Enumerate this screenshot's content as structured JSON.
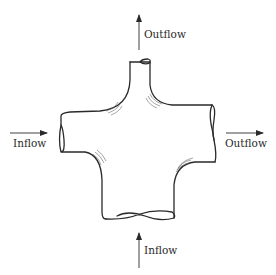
{
  "diagram": {
    "type": "four-way pipe junction flow diagram",
    "colors": {
      "stroke": "#2a2a2a",
      "hatch": "#6a6a6a",
      "background": "#ffffff"
    },
    "labels": {
      "top": "Outflow",
      "left": "Inflow",
      "right": "Outflow",
      "bottom": "Inflow"
    },
    "arrows": [
      {
        "id": "top",
        "direction": "up",
        "meaning": "Outflow"
      },
      {
        "id": "left",
        "direction": "right",
        "meaning": "Inflow"
      },
      {
        "id": "right",
        "direction": "right",
        "meaning": "Outflow"
      },
      {
        "id": "bottom",
        "direction": "up",
        "meaning": "Inflow"
      }
    ]
  }
}
